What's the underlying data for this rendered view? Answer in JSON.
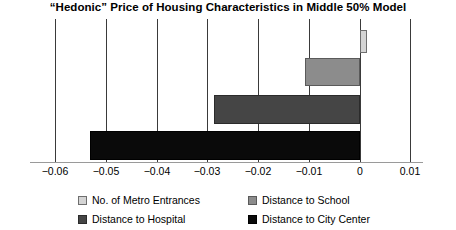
{
  "chart_data": {
    "type": "bar",
    "orientation": "horizontal",
    "title": "“Hedonic” Price of Housing Characteristics in Middle 50% Model",
    "xlabel": "",
    "ylabel": "",
    "xlim": [
      -0.065,
      0.0125
    ],
    "grid": true,
    "grid_axis": "x",
    "legend_position": "bottom",
    "legend_columns": 2,
    "categories": [
      "No. of Metro Entrances",
      "Distance to School",
      "Distance to Hospital",
      "Distance to City Center"
    ],
    "values": [
      0.0015,
      -0.0107,
      -0.0288,
      -0.0532
    ],
    "bar_colors": [
      "#d4d4d4",
      "#8c8c8c",
      "#454545",
      "#0a0a0a"
    ],
    "xticks": [
      -0.06,
      -0.05,
      -0.04,
      -0.03,
      -0.02,
      -0.01,
      0,
      0.01
    ],
    "xtick_labels": [
      "−0.06",
      "−0.05",
      "−0.04",
      "−0.03",
      "−0.02",
      "−0.01",
      "0",
      "0.01"
    ]
  },
  "legend": {
    "items": [
      {
        "label": "No. of Metro Entrances",
        "swatch_class": "sw-metro",
        "swatch_color": "#d4d4d4"
      },
      {
        "label": "Distance to School",
        "swatch_class": "sw-school",
        "swatch_color": "#8c8c8c"
      },
      {
        "label": "Distance to Hospital",
        "swatch_class": "sw-hospital",
        "swatch_color": "#454545"
      },
      {
        "label": "Distance to City Center",
        "swatch_class": "sw-city",
        "swatch_color": "#0a0a0a"
      }
    ]
  }
}
